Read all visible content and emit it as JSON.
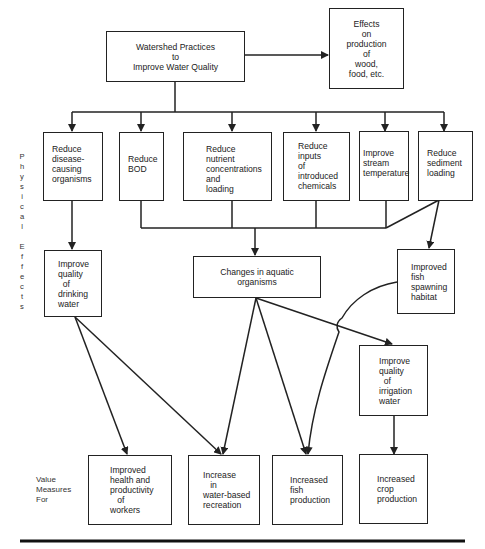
{
  "diagram": {
    "root": {
      "label": "Watershed Practices\nto\nImprove Water Quality"
    },
    "side_effect": {
      "label": "Effects\non\nproduction\nof\nwood,\nfood, etc."
    },
    "physical_effects": [
      {
        "id": "disease",
        "label": "Reduce\ndisease-\ncausing\norganisms"
      },
      {
        "id": "bod",
        "label": "Reduce\nBOD"
      },
      {
        "id": "nutrient",
        "label": "Reduce\nnutrient\nconcentrations\nand\nloading"
      },
      {
        "id": "chemicals",
        "label": "Reduce\ninputs\nof\nintroduced\nchemicals"
      },
      {
        "id": "temperature",
        "label": "Improve\nstream\ntemperature"
      },
      {
        "id": "sediment",
        "label": "Reduce\nsediment\nloading"
      }
    ],
    "intermediate": [
      {
        "id": "drinking",
        "label": "Improve\nquality\n  of\ndrinking\nwater"
      },
      {
        "id": "aquatic",
        "label": "Changes in aquatic\norganisms"
      },
      {
        "id": "spawning",
        "label": "Improved\nfish\nspawning\nhabitat"
      },
      {
        "id": "irrigation",
        "label": "Improve\nquality\n  of\nirrigation\nwater"
      }
    ],
    "value_measures": [
      {
        "id": "health",
        "label": "Improved\nhealth and\nproductivity\n   of\nworkers"
      },
      {
        "id": "recreation",
        "label": "Increase\n   in\nwater-based\nrecreation"
      },
      {
        "id": "fish",
        "label": "Increased\nfish\nproduction"
      },
      {
        "id": "crop",
        "label": "Increased\ncrop\nproduction"
      }
    ],
    "side_labels": {
      "physical_effects": "P\nh\ny\ns\ni\nc\na\nl\n\nE\nf\nf\ne\nc\nt\ns",
      "value_measures": "Value\nMeasures\nFor"
    },
    "edges": [
      [
        "root",
        "side_effect"
      ],
      [
        "root",
        "disease"
      ],
      [
        "root",
        "bod"
      ],
      [
        "root",
        "nutrient"
      ],
      [
        "root",
        "chemicals"
      ],
      [
        "root",
        "temperature"
      ],
      [
        "root",
        "sediment"
      ],
      [
        "disease",
        "drinking"
      ],
      [
        "bod",
        "aquatic"
      ],
      [
        "nutrient",
        "aquatic"
      ],
      [
        "chemicals",
        "aquatic"
      ],
      [
        "temperature",
        "aquatic"
      ],
      [
        "sediment",
        "aquatic"
      ],
      [
        "sediment",
        "spawning"
      ],
      [
        "drinking",
        "health"
      ],
      [
        "drinking",
        "recreation"
      ],
      [
        "aquatic",
        "recreation"
      ],
      [
        "aquatic",
        "fish"
      ],
      [
        "aquatic",
        "irrigation"
      ],
      [
        "spawning",
        "fish"
      ],
      [
        "irrigation",
        "crop"
      ]
    ],
    "colors": {
      "line": "#222222",
      "background": "#ffffff"
    }
  }
}
